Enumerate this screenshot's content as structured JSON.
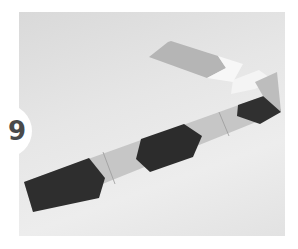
{
  "step": {
    "number": "9"
  },
  "photo": {
    "subject": "sewn fabric strip with dark and light pieced segments, folded end",
    "colors": {
      "background": "#e4e4e4",
      "dark_fabric": "#2f2f2f",
      "light_fabric": "#c8c8c8",
      "mid_fabric": "#b0b0b0",
      "white_fabric": "#f6f6f6"
    }
  }
}
